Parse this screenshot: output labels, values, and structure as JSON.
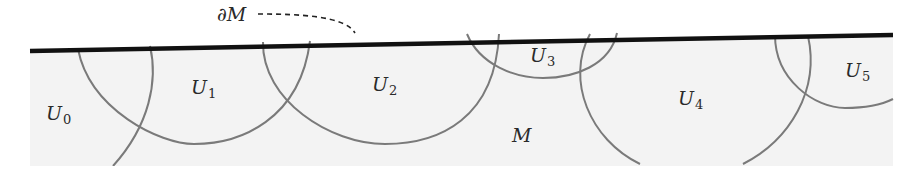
{
  "diagram": {
    "colors": {
      "background": "#ffffff",
      "region_fill": "#f3f3f3",
      "boundary": "#111111",
      "arcs": "#7a7a7a",
      "text": "#2a2a2a"
    },
    "boundary_label": "∂M",
    "manifold_label": "M",
    "charts": [
      {
        "symbol": "U",
        "index": "0"
      },
      {
        "symbol": "U",
        "index": "1"
      },
      {
        "symbol": "U",
        "index": "2"
      },
      {
        "symbol": "U",
        "index": "3"
      },
      {
        "symbol": "U",
        "index": "4"
      },
      {
        "symbol": "U",
        "index": "5"
      }
    ]
  }
}
